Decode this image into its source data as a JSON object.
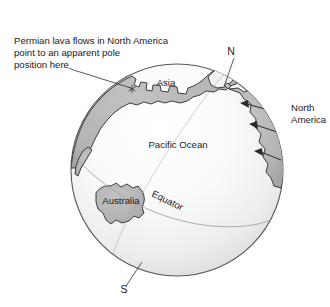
{
  "figure": {
    "background_color": "#ffffff"
  },
  "annotation": {
    "name": "permian-lava-annotation",
    "line1": "Permian lava flows in North America",
    "line2": "point to an apparent pole",
    "line3": "position here",
    "leader_description": "line from text to star marker on globe"
  },
  "globe": {
    "outline_color": "#565656",
    "ocean_fill_light": "#fdfdfd",
    "ocean_fill_dark": "#dcdcdc",
    "land_fill": "#b4b4b4",
    "land_stroke": "#2b2b2b",
    "grid_color": "#9a9a9a",
    "center_x": 177,
    "center_y": 170,
    "radius_x": 106,
    "radius_y": 106
  },
  "labels": {
    "north_pole": "N",
    "south_pole": "S",
    "asia": "Asia",
    "australia": "Australia",
    "north_america_line1": "North",
    "north_america_line2": "America",
    "pacific_ocean": "Pacific Ocean",
    "equator": "Equator"
  },
  "markers": {
    "apparent_pole_star": "*",
    "apparent_pole_star_x": 132,
    "apparent_pole_star_y": 89
  },
  "flow_arrows": {
    "name": "lava-flow-direction-arrows",
    "count": 3,
    "direction": "pointing northwest toward apparent pole",
    "color": "#2b2b2b"
  }
}
